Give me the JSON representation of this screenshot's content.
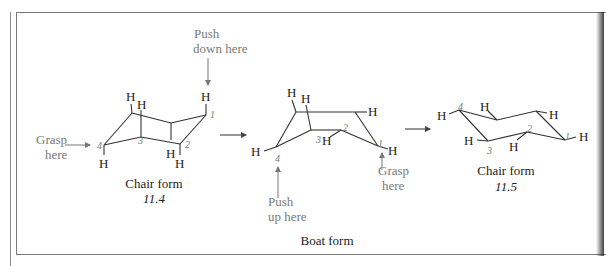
{
  "figure": {
    "chair1": {
      "title": "Chair form",
      "number": "11.4"
    },
    "boat": {
      "title": "Boat form"
    },
    "chair2": {
      "title": "Chair form",
      "number": "11.5"
    },
    "annotations": {
      "grasp_left_1": "Grasp",
      "grasp_left_2": "here",
      "push_down_1": "Push",
      "push_down_2": "down here",
      "push_up_1": "Push",
      "push_up_2": "up here",
      "grasp_right_1": "Grasp",
      "grasp_right_2": "here"
    },
    "atom_label": "H",
    "carbon_numbers": [
      "1",
      "2",
      "3",
      "4"
    ]
  }
}
